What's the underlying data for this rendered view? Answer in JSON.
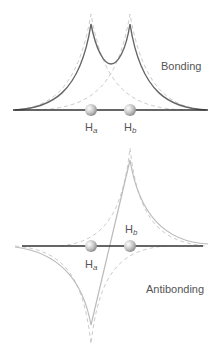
{
  "diagram": {
    "type": "molecular-orbital-wavefunction",
    "colors": {
      "background": "#ffffff",
      "axis": "#333333",
      "bonding_curve": "#666666",
      "antibonding_curve": "#bbbbbb",
      "atomic_orbital_dashed": "#cccccc",
      "label_text": "#555555",
      "atom_fill": "#bbbbbb"
    },
    "bonding": {
      "title": "Bonding",
      "atoms": [
        {
          "symbol": "H",
          "subscript": "a",
          "x": 91,
          "y": 110
        },
        {
          "symbol": "H",
          "subscript": "b",
          "x": 130,
          "y": 110
        }
      ],
      "axis": {
        "x1": 13,
        "x2": 208,
        "y": 110
      }
    },
    "antibonding": {
      "title": "Antibonding",
      "atoms": [
        {
          "symbol": "H",
          "subscript": "a",
          "x": 91,
          "y": 246
        },
        {
          "symbol": "H",
          "subscript": "b",
          "x": 130,
          "y": 246
        }
      ],
      "axis": {
        "x1": 22,
        "x2": 203,
        "y": 246
      }
    }
  }
}
